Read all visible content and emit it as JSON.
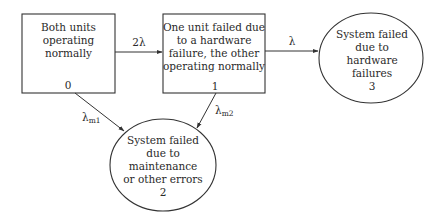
{
  "diagram": {
    "type": "state-transition (Markov) diagram",
    "colors": {
      "stroke": "#333333",
      "text": "#2a2a2a",
      "background": "#ffffff"
    },
    "nodes": [
      {
        "id": "0",
        "shape": "rectangle",
        "lines": [
          "Both units",
          "operating",
          "normally"
        ],
        "state_number": "0"
      },
      {
        "id": "1",
        "shape": "rectangle",
        "lines": [
          "One unit failed due",
          "to a hardware",
          "failure, the other",
          "operating normally"
        ],
        "state_number": "1"
      },
      {
        "id": "2",
        "shape": "circle",
        "lines": [
          "System failed",
          "due to",
          "maintenance",
          "or other errors"
        ],
        "state_number": "2"
      },
      {
        "id": "3",
        "shape": "circle",
        "lines": [
          "System failed",
          "due to",
          "hardware",
          "failures"
        ],
        "state_number": "3"
      }
    ],
    "edges": [
      {
        "from": "0",
        "to": "1",
        "label": "2λ",
        "label_main": "2λ",
        "label_sub": ""
      },
      {
        "from": "1",
        "to": "3",
        "label": "λ",
        "label_main": "λ",
        "label_sub": ""
      },
      {
        "from": "0",
        "to": "2",
        "label": "λm1",
        "label_main": "λ",
        "label_sub": "m1"
      },
      {
        "from": "1",
        "to": "2",
        "label": "λm2",
        "label_main": "λ",
        "label_sub": "m2"
      }
    ]
  }
}
